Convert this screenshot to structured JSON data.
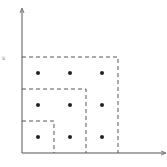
{
  "diagram": {
    "type": "nested-dashed-boxes-grid",
    "y_axis_label": "s",
    "colors": {
      "axis": "#555555",
      "dash": "#444444",
      "dot": "#222222",
      "background": "#ffffff"
    },
    "axes": {
      "origin": [
        22,
        153
      ],
      "x_end": [
        165,
        153
      ],
      "y_end": [
        22,
        10
      ]
    },
    "boxes": [
      {
        "name": "small",
        "top": 121,
        "right": 54
      },
      {
        "name": "medium",
        "top": 89,
        "right": 86
      },
      {
        "name": "large",
        "top": 57,
        "right": 118
      }
    ],
    "dots": {
      "columns_x": [
        38,
        70,
        102
      ],
      "rows_y": [
        73,
        105,
        137
      ]
    }
  }
}
